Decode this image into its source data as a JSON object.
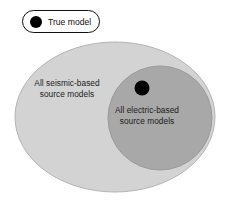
{
  "figure": {
    "type": "venn-diagram",
    "background_color": "#ffffff",
    "width": 241,
    "height": 203
  },
  "legend": {
    "marker_label": "True model",
    "marker_shape": "filled-circle",
    "marker_color": "#000000",
    "border_color": "#111111",
    "background_color": "#ffffff"
  },
  "sets": {
    "outer": {
      "name": "all-seismic-based-source-models",
      "label_line1": "All seismic-based",
      "label_line2": "source models",
      "fill_color": "#d3d3d3",
      "stroke_color": "#b4b4b4"
    },
    "inner": {
      "name": "all-electric-based-source-models",
      "label_line1": "All electric-based",
      "label_line2": "source models",
      "fill_color": "#a8a8a8",
      "stroke_color": "#9a9a9a"
    }
  },
  "points": [
    {
      "name": "true-model-point",
      "label": "True model",
      "color": "#000000",
      "inside_set": "all-electric-based-source-models"
    }
  ]
}
